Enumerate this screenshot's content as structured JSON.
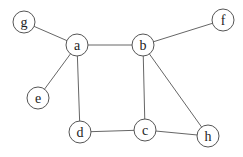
{
  "graph": {
    "nodes": [
      {
        "id": "g",
        "label": "g",
        "x": 24,
        "y": 22
      },
      {
        "id": "a",
        "label": "a",
        "x": 77,
        "y": 45
      },
      {
        "id": "b",
        "label": "b",
        "x": 143,
        "y": 45
      },
      {
        "id": "f",
        "label": "f",
        "x": 223,
        "y": 20
      },
      {
        "id": "e",
        "label": "e",
        "x": 38,
        "y": 98
      },
      {
        "id": "d",
        "label": "d",
        "x": 80,
        "y": 132
      },
      {
        "id": "c",
        "label": "c",
        "x": 145,
        "y": 130
      },
      {
        "id": "h",
        "label": "h",
        "x": 208,
        "y": 136
      }
    ],
    "edges": [
      [
        "g",
        "a"
      ],
      [
        "a",
        "b"
      ],
      [
        "a",
        "e"
      ],
      [
        "a",
        "d"
      ],
      [
        "b",
        "f"
      ],
      [
        "b",
        "c"
      ],
      [
        "b",
        "h"
      ],
      [
        "d",
        "c"
      ],
      [
        "c",
        "h"
      ]
    ],
    "node_radius": 11
  }
}
